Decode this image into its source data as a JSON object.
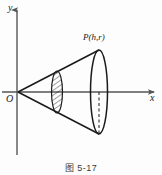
{
  "figure": {
    "caption_prefix": "图",
    "caption_number": "5-17",
    "caption_full": "图 5-17",
    "axes": {
      "y_label": "y",
      "x_label": "x",
      "origin_label": "O",
      "y_axis_top_px": 8,
      "y_axis_bottom_px": 155,
      "x_axis_left_px": 2,
      "x_axis_right_px": 157,
      "origin_px": [
        17,
        92
      ]
    },
    "point_label": "P(h,r)",
    "point_px": [
      99,
      48
    ],
    "cone": {
      "apex_px": [
        18,
        92
      ],
      "base_center_px": [
        99,
        92
      ],
      "base_semi_minor_px": 8,
      "base_semi_major_px": 42,
      "cross_section_center_px": [
        57,
        92
      ],
      "cross_section_semi_minor_px": 5,
      "cross_section_semi_major_px": 21,
      "cross_section_hatched": true
    },
    "colors": {
      "background": "#fdfdfd",
      "stroke": "#1a1a1a",
      "axis": "#555555",
      "hatch": "#2a2a2a",
      "caption_text": "#3a3a3a"
    }
  }
}
